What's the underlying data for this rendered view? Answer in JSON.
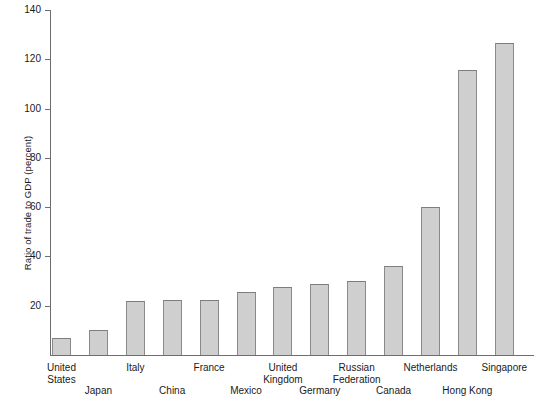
{
  "chart_data": {
    "type": "bar",
    "title": "",
    "xlabel": "",
    "ylabel": "Ratio of trade to GDP (percent)",
    "ylim": [
      0,
      140
    ],
    "ytick_labels": [
      "0",
      "20",
      "40",
      "60",
      "80",
      "100",
      "120",
      "140"
    ],
    "yticks": [
      0,
      20,
      40,
      60,
      80,
      100,
      120,
      140
    ],
    "grid": false,
    "legend": "none",
    "categories": [
      "United States",
      "Japan",
      "Italy",
      "China",
      "France",
      "Mexico",
      "United Kingdom",
      "Germany",
      "Russian Federation",
      "Canada",
      "Netherlands",
      "Hong Kong",
      "Singapore"
    ],
    "values": [
      7,
      10,
      22,
      22.5,
      22.5,
      25.5,
      27.5,
      29,
      30,
      36,
      60,
      115.5,
      126.5
    ],
    "bar_fill_color": "#cfcfcf",
    "bar_edge_color": "#8a8a8a",
    "axis_color": "#6e6e6e",
    "label_rows": [
      1,
      2,
      1,
      2,
      1,
      2,
      1,
      2,
      1,
      2,
      1,
      2,
      1
    ]
  }
}
